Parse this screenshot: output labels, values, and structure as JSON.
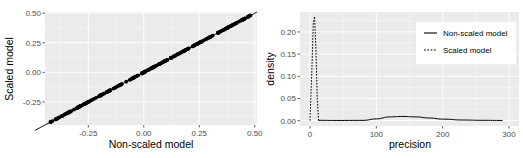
{
  "chart_data": [
    {
      "type": "scatter",
      "title": "",
      "xlabel": "Non-scaled model",
      "ylabel": "Scaled model",
      "xlim": [
        -0.445,
        0.51
      ],
      "ylim": [
        -0.445,
        0.51
      ],
      "x_ticks": [
        -0.25,
        0.0,
        0.25,
        0.5
      ],
      "x_tick_labels": [
        "-0.25",
        "0.00",
        "0.25",
        "0.50"
      ],
      "y_ticks": [
        -0.25,
        0.0,
        0.25,
        0.5
      ],
      "y_tick_labels": [
        "-0.25",
        "0.00",
        "0.25",
        "0.50"
      ],
      "grid": true,
      "reference_line": {
        "slope": 1,
        "intercept": 0
      },
      "points_range": [
        -0.42,
        0.48
      ],
      "note": "Dense points lie exactly on the y = x identity line"
    },
    {
      "type": "line",
      "title": "",
      "xlabel": "precision",
      "ylabel": "density",
      "xlim": [
        -15,
        315
      ],
      "ylim": [
        -0.012,
        0.245
      ],
      "x_ticks": [
        0,
        100,
        200,
        300
      ],
      "x_tick_labels": [
        "0",
        "100",
        "200",
        "300"
      ],
      "y_ticks": [
        0.0,
        0.05,
        0.1,
        0.15,
        0.2
      ],
      "y_tick_labels": [
        "0.00",
        "0.05",
        "0.10",
        "0.15",
        "0.20"
      ],
      "grid": true,
      "legend_position": "top-right inside",
      "series": [
        {
          "name": "Non-scaled model",
          "linetype": "solid",
          "x": [
            13,
            40,
            80,
            100,
            120,
            140,
            160,
            180,
            200,
            230,
            260,
            290
          ],
          "y": [
            0.0008,
            0.0005,
            0.0007,
            0.004,
            0.0085,
            0.0095,
            0.0085,
            0.006,
            0.0035,
            0.0015,
            0.0008,
            0.0005
          ]
        },
        {
          "name": "Scaled model",
          "linetype": "dashed",
          "x": [
            0,
            3,
            5,
            7,
            9,
            11,
            13
          ],
          "y": [
            0.0,
            0.12,
            0.22,
            0.235,
            0.16,
            0.05,
            0.0
          ]
        }
      ]
    }
  ],
  "legend": {
    "items": [
      {
        "label": "Non-scaled model",
        "linetype": "solid"
      },
      {
        "label": "Scaled model",
        "linetype": "dashed"
      }
    ]
  },
  "colors": {
    "panel_bg": "#ebebeb",
    "grid_major": "#ffffff",
    "line": "#000000",
    "tick_text": "#4d4d4d"
  }
}
